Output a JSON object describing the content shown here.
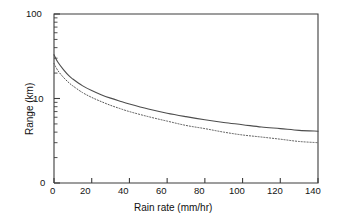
{
  "chart_data": {
    "type": "line",
    "title": "",
    "xlabel": "Rain rate (mm/hr)",
    "ylabel": "Range (km)",
    "xlim": [
      0,
      140
    ],
    "ylim": [
      1,
      100
    ],
    "yscale": "log",
    "xscale": "linear",
    "grid": false,
    "legend": "none",
    "xticks": [
      "0",
      "20",
      "40",
      "60",
      "80",
      "100",
      "120",
      "140"
    ],
    "xtick_values": [
      0,
      20,
      40,
      60,
      80,
      100,
      120,
      140
    ],
    "yticks": [
      "100",
      "10",
      "0"
    ],
    "ytick_values": [
      100,
      10,
      1
    ],
    "y_minor_ticks": [
      90,
      80,
      70,
      60,
      50,
      40,
      30,
      20,
      9,
      8,
      7,
      6,
      5,
      4,
      3,
      2
    ],
    "series": [
      {
        "name": "upper-curve",
        "style": "solid",
        "color": "#4d4d4d",
        "x": [
          0,
          2,
          5,
          8,
          10,
          15,
          20,
          25,
          30,
          35,
          40,
          50,
          60,
          70,
          80,
          90,
          100,
          110,
          120,
          130,
          140
        ],
        "y": [
          33.0,
          27.0,
          22.0,
          18.5,
          17.0,
          14.2,
          12.4,
          11.1,
          10.1,
          9.3,
          8.6,
          7.5,
          6.7,
          6.1,
          5.6,
          5.2,
          4.9,
          4.6,
          4.4,
          4.2,
          4.1
        ]
      },
      {
        "name": "lower-curve",
        "style": "dotted",
        "color": "#555555",
        "x": [
          0,
          2,
          5,
          8,
          10,
          15,
          20,
          25,
          30,
          35,
          40,
          50,
          60,
          70,
          80,
          90,
          100,
          110,
          120,
          130,
          140
        ],
        "y": [
          26.0,
          21.5,
          17.8,
          15.3,
          14.1,
          11.8,
          10.3,
          9.2,
          8.3,
          7.6,
          7.0,
          6.1,
          5.4,
          4.8,
          4.4,
          4.0,
          3.7,
          3.5,
          3.3,
          3.1,
          3.0
        ]
      }
    ]
  },
  "axes": {
    "x_title": "Rain rate (mm/hr)",
    "y_title": "Range (km)",
    "x_labels": [
      "0",
      "20",
      "40",
      "60",
      "80",
      "100",
      "120",
      "140"
    ],
    "y_labels": [
      "100",
      "10",
      "0"
    ]
  },
  "colors": {
    "frame": "#3c3c3c",
    "solid_series": "#4d4d4d",
    "dotted_series": "#555555",
    "background": "#ffffff",
    "text": "#141414"
  }
}
